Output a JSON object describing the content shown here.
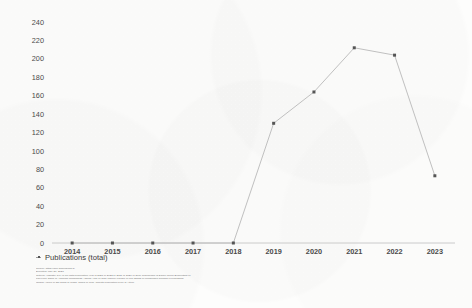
{
  "chart_data": {
    "type": "line",
    "title": "",
    "xlabel": "",
    "ylabel": "",
    "categories": [
      "2014",
      "2015",
      "2016",
      "2017",
      "2018",
      "2019",
      "2020",
      "2021",
      "2022",
      "2023"
    ],
    "series": [
      {
        "name": "Publications (total)",
        "values": [
          0,
          0,
          0,
          0,
          0,
          130,
          164,
          212,
          204,
          73
        ]
      }
    ],
    "ylim": [
      0,
      240
    ],
    "ytick_step": 20,
    "yticks": [
      0,
      20,
      40,
      60,
      80,
      100,
      120,
      140,
      160,
      180,
      200,
      220,
      240
    ],
    "grid": false,
    "legend_position": "below-left",
    "line_color": "#b9b9b9",
    "marker_color": "#555555",
    "axis_color": "#bfbfbf",
    "background_color": "#fdfdfc"
  },
  "legend": {
    "entries": [
      {
        "label": "Publications (total)",
        "marker": "line-square-marker"
      }
    ]
  },
  "footnote": {
    "lines": [
      "Source: https://app.dimensions.ai",
      "Exported: May 27, 2023",
      "Criteria: \"Industry 5.0\" in full-data Publication Year is 2023 or 2022 or 2021 or 2020 or 2019 Researcher is Daniel Julien Blumenthal or",
      "Pau Loke Show or Abdullah Mohammad Ahmad Azmi or Jose Manuel Lozano or Min Zhang or Mingjinwen Jinzhan in Publishing",
      "landed Aurien or Zhi Gang or Mohd. aimed in Web Aspects Publication Type is Article"
    ]
  }
}
